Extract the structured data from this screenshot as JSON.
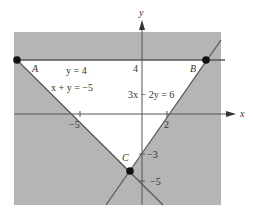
{
  "figure": {
    "axis_labels": {
      "x": "x",
      "y": "y"
    },
    "ticks": {
      "x": [
        {
          "value": -5,
          "label": "−5"
        },
        {
          "value": 2,
          "label": "2"
        }
      ],
      "y": [
        {
          "value": 4,
          "label": "4"
        },
        {
          "value": -3,
          "label": "−3"
        },
        {
          "value": -5,
          "label": "−5"
        }
      ]
    },
    "lines": [
      {
        "id": "y4",
        "equation": "y = 4"
      },
      {
        "id": "xy",
        "equation": "x + y = −5"
      },
      {
        "id": "l3x",
        "equation": "3x − 2y = 6"
      }
    ],
    "points": [
      {
        "label": "A",
        "x": -10,
        "y": 4
      },
      {
        "label": "B",
        "x": 5,
        "y": 4
      },
      {
        "label": "C",
        "x": -0.8,
        "y": -4.2
      }
    ],
    "region": "feasible triangle ABC unshaded; exterior shaded",
    "colors": {
      "shade": "#b4b4b4",
      "line": "#5a5a5a",
      "point": "#111111"
    }
  }
}
